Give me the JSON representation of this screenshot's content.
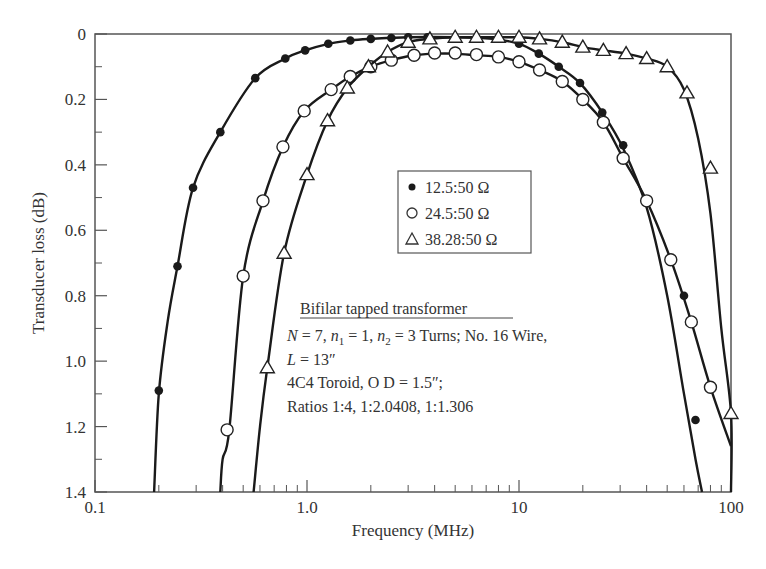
{
  "chart_data": {
    "type": "line",
    "title": "",
    "xlabel": "Frequency (MHz)",
    "ylabel": "Transducer loss (dB)",
    "xscale": "log",
    "xlim": [
      0.1,
      100
    ],
    "ylim": [
      0,
      1.4
    ],
    "y_inverted": true,
    "xticks": [
      {
        "value": 0.1,
        "label": "0.1"
      },
      {
        "value": 1.0,
        "label": "1.0"
      },
      {
        "value": 10,
        "label": "10"
      },
      {
        "value": 100,
        "label": "100"
      }
    ],
    "yticks": [
      {
        "value": 0,
        "label": "0"
      },
      {
        "value": 0.2,
        "label": "0.2"
      },
      {
        "value": 0.4,
        "label": "0.4"
      },
      {
        "value": 0.6,
        "label": "0.6"
      },
      {
        "value": 0.8,
        "label": "0.8"
      },
      {
        "value": 1.0,
        "label": "1.0"
      },
      {
        "value": 1.2,
        "label": "1.2"
      },
      {
        "value": 1.4,
        "label": "1.4"
      }
    ],
    "grid": false,
    "legend_position": "inside-center",
    "series": [
      {
        "name": "12.5:50 Ω",
        "marker": "filled-circle",
        "curve_x": [
          0.19,
          0.2,
          0.22,
          0.245,
          0.29,
          0.39,
          0.57,
          0.79,
          0.98,
          1.26,
          1.6,
          2.0,
          3.0,
          5.0,
          7.5,
          10,
          12.4,
          15.4,
          19.4,
          24.7,
          31,
          40,
          50,
          60,
          68,
          73
        ],
        "curve_y": [
          1.4,
          1.1,
          0.88,
          0.71,
          0.47,
          0.3,
          0.135,
          0.075,
          0.05,
          0.03,
          0.02,
          0.015,
          0.01,
          0.01,
          0.015,
          0.03,
          0.06,
          0.1,
          0.15,
          0.24,
          0.35,
          0.53,
          0.8,
          1.1,
          1.3,
          1.4
        ],
        "points_x": [
          0.2,
          0.245,
          0.29,
          0.39,
          0.57,
          0.79,
          0.98,
          1.26,
          1.6,
          2.0,
          2.5,
          3.0,
          3.7,
          10,
          12.4,
          15.4,
          19.4,
          24.7,
          31,
          60,
          68
        ],
        "points_y": [
          1.09,
          0.71,
          0.47,
          0.3,
          0.135,
          0.075,
          0.05,
          0.03,
          0.02,
          0.015,
          0.012,
          0.01,
          0.01,
          0.03,
          0.06,
          0.1,
          0.15,
          0.24,
          0.34,
          0.8,
          1.18
        ]
      },
      {
        "name": "24.5:50 Ω",
        "marker": "open-circle",
        "curve_x": [
          0.39,
          0.4,
          0.43,
          0.5,
          0.62,
          0.77,
          0.97,
          1.3,
          1.6,
          2.0,
          2.5,
          3.2,
          4.0,
          5.0,
          6.3,
          8.0,
          10,
          12.5,
          16,
          20,
          25,
          31,
          40,
          52,
          65,
          80,
          100
        ],
        "curve_y": [
          1.4,
          1.3,
          1.21,
          0.74,
          0.51,
          0.345,
          0.235,
          0.17,
          0.13,
          0.1,
          0.08,
          0.065,
          0.06,
          0.06,
          0.065,
          0.07,
          0.085,
          0.11,
          0.145,
          0.2,
          0.27,
          0.38,
          0.51,
          0.69,
          0.88,
          1.08,
          1.26
        ],
        "points_x": [
          0.42,
          0.5,
          0.62,
          0.77,
          0.97,
          1.3,
          1.6,
          2.0,
          2.5,
          3.2,
          4.0,
          5.0,
          6.3,
          8.0,
          10,
          12.5,
          16,
          20,
          25,
          31,
          40,
          52,
          65,
          80
        ],
        "points_y": [
          1.21,
          0.74,
          0.51,
          0.345,
          0.235,
          0.17,
          0.13,
          0.1,
          0.08,
          0.065,
          0.058,
          0.058,
          0.063,
          0.07,
          0.085,
          0.11,
          0.145,
          0.2,
          0.27,
          0.38,
          0.51,
          0.69,
          0.88,
          1.08
        ]
      },
      {
        "name": "38.28:50 Ω",
        "marker": "open-triangle",
        "curve_x": [
          0.56,
          0.6,
          0.65,
          0.78,
          1.0,
          1.25,
          1.55,
          1.95,
          2.4,
          3.0,
          3.8,
          5.0,
          6.3,
          8.0,
          10,
          12.5,
          16,
          20,
          25,
          32,
          40,
          50,
          60,
          70,
          80,
          90,
          100,
          100
        ],
        "curve_y": [
          1.4,
          1.2,
          1.02,
          0.67,
          0.43,
          0.265,
          0.165,
          0.1,
          0.055,
          0.025,
          0.015,
          0.01,
          0.01,
          0.01,
          0.01,
          0.015,
          0.025,
          0.04,
          0.05,
          0.06,
          0.075,
          0.1,
          0.17,
          0.32,
          0.55,
          0.9,
          1.16,
          1.4
        ],
        "points_x": [
          0.65,
          0.78,
          1.0,
          1.25,
          1.55,
          1.95,
          2.4,
          3.0,
          3.8,
          5.0,
          6.3,
          8.0,
          10,
          12.5,
          16,
          20,
          25,
          32,
          40,
          50,
          62,
          80,
          100
        ],
        "points_y": [
          1.02,
          0.67,
          0.43,
          0.265,
          0.165,
          0.1,
          0.055,
          0.025,
          0.015,
          0.01,
          0.01,
          0.01,
          0.01,
          0.015,
          0.025,
          0.04,
          0.05,
          0.06,
          0.075,
          0.1,
          0.18,
          0.41,
          1.16
        ]
      }
    ],
    "legend": [
      {
        "symbol": "●",
        "label": "12.5:50 Ω"
      },
      {
        "symbol": "○",
        "label": "24.5:50 Ω"
      },
      {
        "symbol": "△",
        "label": "38.28:50 Ω"
      }
    ],
    "annotations": {
      "title": "Bifilar tapped transformer",
      "lines": [
        "N = 7, n1 = 1, n2 = 3 Turns; No. 16 Wire,",
        "L = 13″",
        "4C4 Toroid, O D = 1.5″;",
        "Ratios 1:4, 1:2.0408, 1:1.306"
      ]
    }
  },
  "labels": {
    "xlabel": "Frequency (MHz)",
    "ylabel": "Transducer loss (dB)",
    "legend_1": "12.5:50 Ω",
    "legend_2": "24.5:50 Ω",
    "legend_3": "38.28:50 Ω",
    "note_title": "Bifilar tapped transformer",
    "note_line1_a": "N",
    "note_line1_b": " = 7, ",
    "note_line1_c": "n",
    "note_line1_d": "1",
    "note_line1_e": " = 1, ",
    "note_line1_f": "n",
    "note_line1_g": "2",
    "note_line1_h": " = 3 Turns; No. 16 Wire,",
    "note_line2_a": "L",
    "note_line2_b": " = 13″",
    "note_line3": "4C4 Toroid, O D = 1.5″;",
    "note_line4": "Ratios 1:4, 1:2.0408, 1:1.306"
  },
  "colors": {
    "line": "#1a1a1a",
    "axis": "#555555",
    "text": "#333333",
    "background": "#ffffff"
  }
}
